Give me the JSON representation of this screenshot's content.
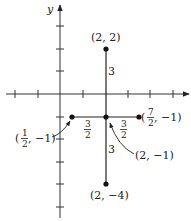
{
  "diagram": {
    "type": "coordinate-plane",
    "axis_labels": {
      "y": "y"
    },
    "origin_px": [
      60,
      94
    ],
    "unit_px": 22.6,
    "x_ticks": [
      -2,
      -1,
      1,
      2,
      3,
      4,
      5
    ],
    "y_ticks": [
      3,
      2,
      1,
      -1,
      -2,
      -3,
      -4,
      -5
    ],
    "points": [
      {
        "id": "top",
        "x": 2,
        "y": 2,
        "label": "(2, 2)"
      },
      {
        "id": "center",
        "x": 2,
        "y": -1,
        "label": "(2, −1)"
      },
      {
        "id": "bottom",
        "x": 2,
        "y": -4,
        "label": "(2, −4)"
      },
      {
        "id": "left",
        "x": 0.5,
        "y": -1,
        "label_num": "1",
        "label_den": "2",
        "label_rest": ", −1)",
        "label_open": "("
      },
      {
        "id": "right",
        "x": 3.5,
        "y": -1,
        "label_num": "7",
        "label_den": "2",
        "label_rest": ", −1)",
        "label_open": "("
      }
    ],
    "segments": [
      {
        "from": "top",
        "to": "bottom",
        "orientation": "vertical"
      },
      {
        "from": "left",
        "to": "right",
        "orientation": "horizontal"
      }
    ],
    "distance_labels": {
      "upper_vertical": "3",
      "lower_vertical": "3",
      "left_horizontal": {
        "num": "3",
        "den": "2"
      },
      "right_horizontal": {
        "num": "3",
        "den": "2"
      }
    },
    "colors": {
      "line": "#222222",
      "point": "#111111"
    }
  }
}
